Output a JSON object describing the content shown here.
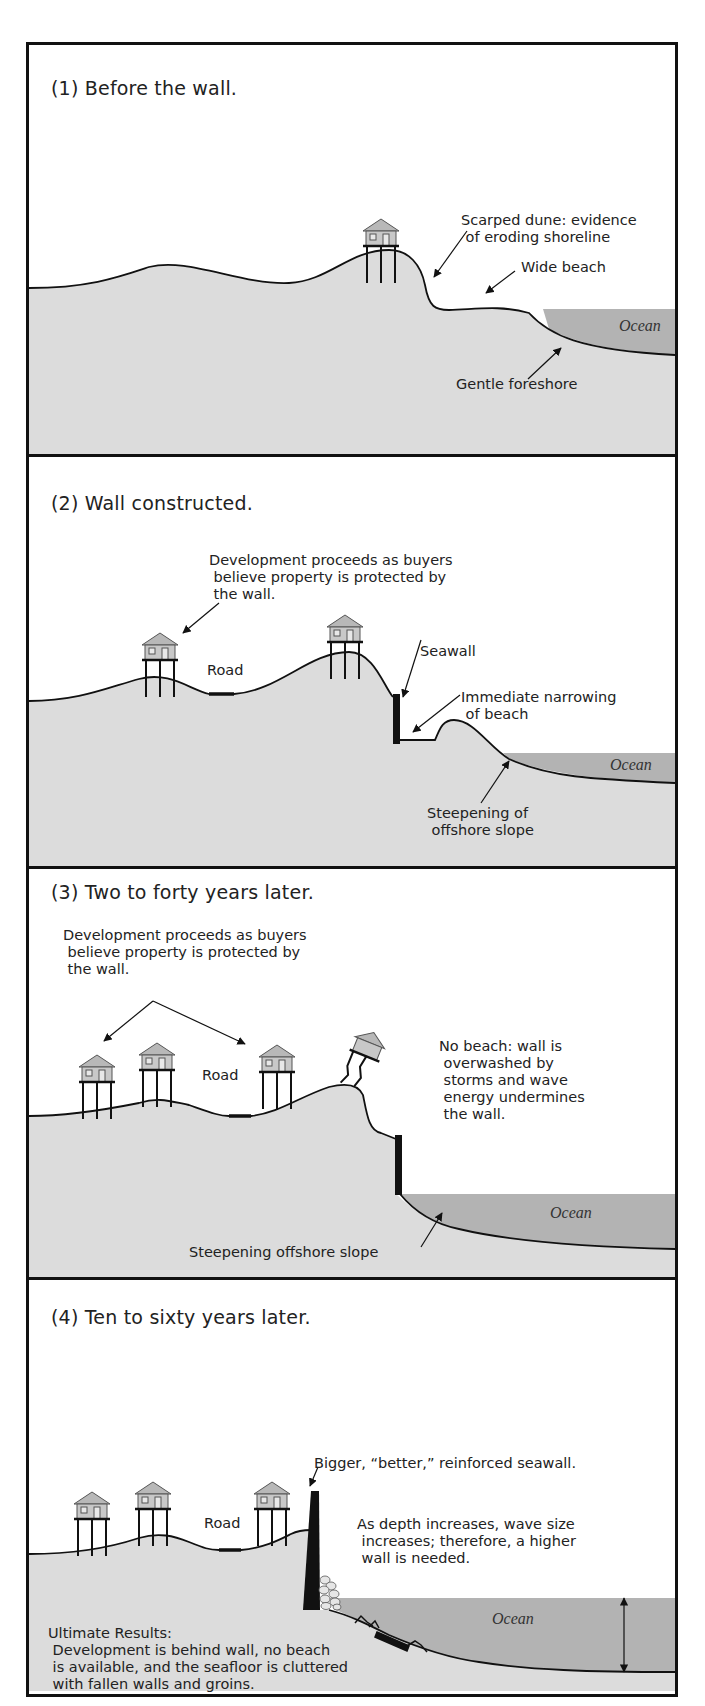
{
  "colors": {
    "land": "#dcdcdc",
    "ocean": "#b3b3b3",
    "outline": "#111111",
    "house": "#b8b8b8"
  },
  "panels": [
    {
      "title": "(1) Before the wall.",
      "labels": {
        "scarped_dune": "Scarped dune: evidence\n of eroding shoreline",
        "wide_beach": "Wide beach",
        "gentle_foreshore": "Gentle foreshore",
        "ocean": "Ocean"
      }
    },
    {
      "title": "(2) Wall constructed.",
      "labels": {
        "development": "Development proceeds as buyers\n believe property is protected by\n the wall.",
        "road": "Road",
        "seawall": "Seawall",
        "narrowing": "Immediate narrowing\n of beach",
        "steepening": "Steepening of\n offshore slope",
        "ocean": "Ocean"
      }
    },
    {
      "title": "(3) Two to forty years later.",
      "labels": {
        "development": "Development proceeds as buyers\n believe property is protected by\n the wall.",
        "road": "Road",
        "no_beach": "No beach: wall is\n overwashed by\n storms and wave\n energy undermines\n the wall.",
        "steepening": "Steepening offshore slope",
        "ocean": "Ocean"
      }
    },
    {
      "title": "(4) Ten to sixty years later.",
      "labels": {
        "bigger_wall": "Bigger, “better,” reinforced seawall.",
        "road": "Road",
        "depth": "As depth increases, wave size\n increases; therefore, a higher\n wall is needed.",
        "ocean": "Ocean",
        "ultimate_heading": "Ultimate Results:",
        "ultimate_body": " Development is behind wall, no beach\n is available, and the seafloor is cluttered\n with fallen walls and groins."
      }
    }
  ]
}
